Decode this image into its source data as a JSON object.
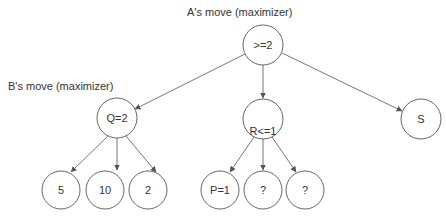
{
  "labels": {
    "a_move": "A's move (maximizer)",
    "b_move": "B's move (maximizer)"
  },
  "nodes": {
    "root": ">=2",
    "q": "Q=2",
    "r": "R<=1",
    "s": "S",
    "q_leaf_1": "5",
    "q_leaf_2": "10",
    "q_leaf_3": "2",
    "r_leaf_1": "P=1",
    "r_leaf_2": "?",
    "r_leaf_3": "?"
  },
  "colors": {
    "stroke": "#555555",
    "text": "#333333",
    "background": "#ffffff"
  }
}
